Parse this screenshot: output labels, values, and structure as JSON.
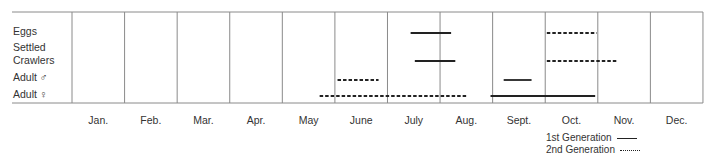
{
  "chart_data": {
    "type": "gantt",
    "title": "",
    "xlabel": "",
    "ylabel": "",
    "categories": [
      "Jan.",
      "Feb.",
      "Mar.",
      "Apr.",
      "May",
      "June",
      "July",
      "Aug.",
      "Sept.",
      "Oct.",
      "Nov.",
      "Dec."
    ],
    "rows": [
      {
        "label": "Eggs",
        "label_lines": [
          "Eggs"
        ]
      },
      {
        "label": "Settled Crawlers",
        "label_lines": [
          "Settled",
          "Crawlers"
        ]
      },
      {
        "label": "Adult ♂",
        "label_lines": [
          "Adult ♂"
        ]
      },
      {
        "label": "Adult ♀",
        "label_lines": [
          "Adult ♀"
        ]
      }
    ],
    "series": [
      {
        "name": "1st Generation",
        "style": "solid",
        "bars": [
          {
            "row": "Eggs",
            "start_month": 6.44,
            "end_month": 7.21
          },
          {
            "row": "Settled Crawlers",
            "start_month": 6.52,
            "end_month": 7.29
          },
          {
            "row": "Adult ♂",
            "start_month": 8.21,
            "end_month": 8.74
          },
          {
            "row": "Adult ♀",
            "start_month": 7.96,
            "end_month": 9.95
          }
        ]
      },
      {
        "name": "2nd Generation",
        "style": "dashed",
        "bars": [
          {
            "row": "Eggs",
            "start_month": 9.03,
            "end_month": 9.98
          },
          {
            "row": "Settled Crawlers",
            "start_month": 9.03,
            "end_month": 10.38
          },
          {
            "row": "Adult ♂",
            "start_month": 5.05,
            "end_month": 5.83
          },
          {
            "row": "Adult ♀",
            "start_month": 4.71,
            "end_month": 7.5
          }
        ]
      }
    ],
    "legend": [
      {
        "label": "1st Generation",
        "style": "solid"
      },
      {
        "label": "2nd Generation",
        "style": "dashed"
      }
    ],
    "legend_position": "bottom-right",
    "grid": "vertical month dividers"
  },
  "labels": {
    "rows": [
      "Eggs",
      "Settled",
      "Crawlers",
      "Adult ♂",
      "Adult ♀"
    ],
    "months": [
      "Jan.",
      "Feb.",
      "Mar.",
      "Apr.",
      "May",
      "June",
      "July",
      "Aug.",
      "Sept.",
      "Oct.",
      "Nov.",
      "Dec."
    ],
    "legend_1st": "1st Generation",
    "legend_2nd": "2nd Generation"
  },
  "colors": {
    "frame": "#8a8a8a",
    "bar": "#222222",
    "text": "#333333"
  }
}
